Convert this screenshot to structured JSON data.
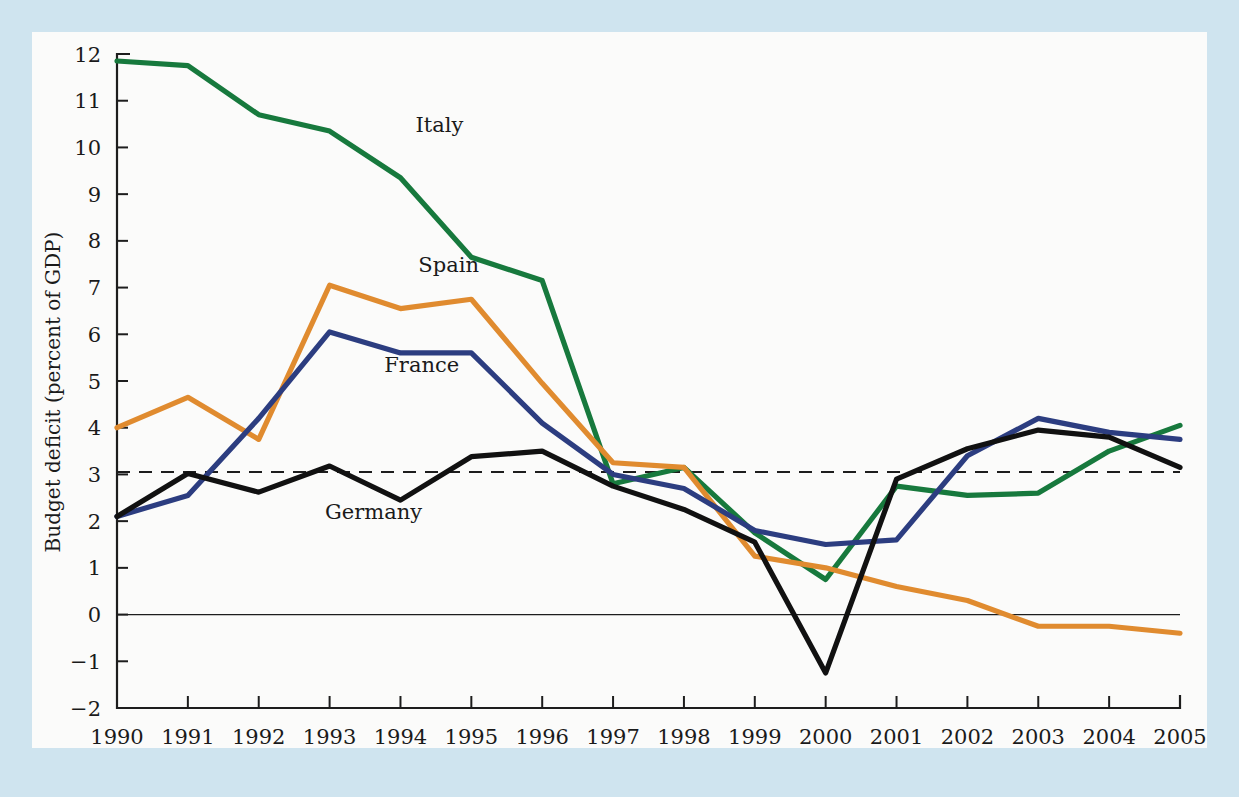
{
  "figure": {
    "background_color": "#cfe4ef",
    "panel_color": "#fbfbfa"
  },
  "chart_data": {
    "type": "line",
    "title": "",
    "subtitle": "",
    "xlabel": "",
    "ylabel": "Budget deficit (percent of GDP)",
    "x": [
      1990,
      1991,
      1992,
      1993,
      1994,
      1995,
      1996,
      1997,
      1998,
      1999,
      2000,
      2001,
      2002,
      2003,
      2004,
      2005
    ],
    "xtick_labels": [
      "1990",
      "1991",
      "1992",
      "1993",
      "1994",
      "1995",
      "1996",
      "1997",
      "1998",
      "1999",
      "2000",
      "2001",
      "2002",
      "2003",
      "2004",
      "2005"
    ],
    "ytick_labels": [
      "12",
      "11",
      "10",
      "9",
      "8",
      "7",
      "6",
      "5",
      "4",
      "3",
      "2",
      "1",
      "0",
      "-1",
      "-2"
    ],
    "ytick_values": [
      12,
      11,
      10,
      9,
      8,
      7,
      6,
      5,
      4,
      3,
      2,
      1,
      0,
      -1,
      -2
    ],
    "xlim": [
      1990,
      2005
    ],
    "ylim": [
      -2,
      12
    ],
    "grid": false,
    "legend_position": "inline-labels",
    "reference_line": {
      "value": 3.05,
      "style": "dashed",
      "label": "",
      "color": "#1d1d1d"
    },
    "zero_line": {
      "value": 0,
      "style": "solid",
      "color": "#1d1d1d"
    },
    "series": [
      {
        "name": "Italy",
        "color": "#17793d",
        "label_x": 1994.55,
        "label_y": 10.33,
        "values": [
          11.85,
          11.75,
          10.7,
          10.35,
          9.35,
          7.65,
          7.15,
          2.8,
          3.15,
          1.75,
          0.75,
          2.75,
          2.55,
          2.6,
          3.5,
          4.05
        ]
      },
      {
        "name": "Spain",
        "color": "#e08b2f",
        "label_x": 1994.68,
        "label_y": 7.33,
        "values": [
          4.0,
          4.65,
          3.75,
          7.05,
          6.55,
          6.75,
          4.95,
          3.25,
          3.15,
          1.25,
          1.0,
          0.6,
          0.3,
          -0.25,
          -0.25,
          -0.4
        ]
      },
      {
        "name": "France",
        "color": "#2c3d80",
        "label_x": 1994.3,
        "label_y": 5.2,
        "values": [
          2.1,
          2.55,
          4.2,
          6.05,
          5.6,
          5.6,
          4.1,
          3.0,
          2.7,
          1.8,
          1.5,
          1.6,
          3.4,
          4.2,
          3.9,
          3.75
        ]
      },
      {
        "name": "Germany",
        "color": "#111111",
        "label_x": 1993.62,
        "label_y": 2.05,
        "values": [
          2.1,
          3.02,
          2.62,
          3.18,
          2.45,
          3.38,
          3.5,
          2.75,
          2.25,
          1.55,
          -1.25,
          2.9,
          3.55,
          3.95,
          3.8,
          3.15
        ]
      }
    ]
  }
}
